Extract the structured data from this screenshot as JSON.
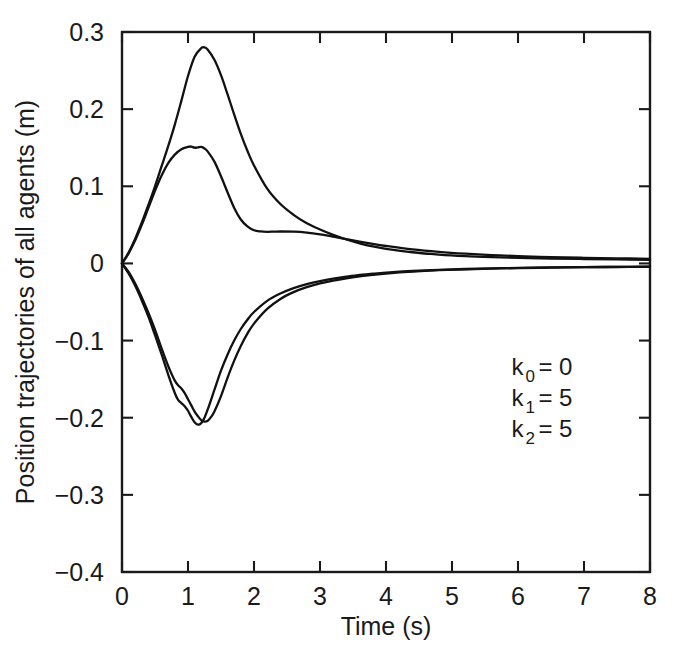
{
  "chart_data": {
    "type": "line",
    "title": "",
    "xlabel": "Time (s)",
    "ylabel": "Position trajectories of all agents (m)",
    "xlim": [
      0,
      8
    ],
    "ylim": [
      -0.4,
      0.3
    ],
    "grid": false,
    "legend": null,
    "xticks": [
      0,
      1,
      2,
      3,
      4,
      5,
      6,
      7,
      8
    ],
    "xticklabels": [
      "0",
      "1",
      "2",
      "3",
      "4",
      "5",
      "6",
      "7",
      "8"
    ],
    "yticks": [
      -0.4,
      -0.3,
      -0.2,
      -0.1,
      0,
      0.1,
      0.2,
      0.3
    ],
    "yticklabels": [
      "−0.4",
      "−0.3",
      "−0.2",
      "−0.1",
      "0",
      "0.1",
      "0.2",
      "0.3"
    ],
    "annotations": [
      {
        "name": "k0",
        "base": "k",
        "sub": "0",
        "eq": "= 0",
        "x": 5.9,
        "y": -0.145
      },
      {
        "name": "k1",
        "base": "k",
        "sub": "1",
        "eq": "= 5",
        "x": 5.9,
        "y": -0.185
      },
      {
        "name": "k2",
        "base": "k",
        "sub": "2",
        "eq": "= 5",
        "x": 5.9,
        "y": -0.225
      }
    ],
    "series": [
      {
        "name": "agent-1-positive-large",
        "color": "#111111",
        "x": [
          0.0,
          0.1,
          0.2,
          0.3,
          0.4,
          0.5,
          0.6,
          0.7,
          0.8,
          0.9,
          1.0,
          1.1,
          1.2,
          1.25,
          1.3,
          1.4,
          1.5,
          1.6,
          1.7,
          1.8,
          1.9,
          2.0,
          2.2,
          2.4,
          2.6,
          2.8,
          3.0,
          3.2,
          3.4,
          3.6,
          3.8,
          4.0,
          4.4,
          4.8,
          5.2,
          5.6,
          6.0,
          6.5,
          7.0,
          7.5,
          8.0
        ],
        "y": [
          0.0,
          0.014,
          0.032,
          0.053,
          0.076,
          0.1,
          0.126,
          0.152,
          0.18,
          0.211,
          0.243,
          0.268,
          0.279,
          0.28,
          0.277,
          0.264,
          0.244,
          0.219,
          0.193,
          0.168,
          0.146,
          0.127,
          0.097,
          0.077,
          0.063,
          0.052,
          0.044,
          0.037,
          0.031,
          0.026,
          0.022,
          0.019,
          0.0145,
          0.0115,
          0.0095,
          0.0082,
          0.0072,
          0.0063,
          0.0057,
          0.0052,
          0.0048
        ]
      },
      {
        "name": "agent-2-positive-small",
        "color": "#111111",
        "x": [
          0.0,
          0.1,
          0.2,
          0.3,
          0.4,
          0.5,
          0.6,
          0.7,
          0.8,
          0.9,
          1.0,
          1.05,
          1.1,
          1.15,
          1.2,
          1.25,
          1.3,
          1.4,
          1.5,
          1.6,
          1.7,
          1.8,
          1.9,
          2.0,
          2.1,
          2.2,
          2.3,
          2.4,
          2.6,
          2.8,
          3.0,
          3.2,
          3.4,
          3.6,
          3.8,
          4.0,
          4.4,
          4.8,
          5.2,
          5.6,
          6.0,
          6.5,
          7.0,
          7.5,
          8.0
        ],
        "y": [
          0.0,
          0.013,
          0.03,
          0.05,
          0.072,
          0.094,
          0.114,
          0.13,
          0.141,
          0.148,
          0.151,
          0.1515,
          0.15,
          0.1505,
          0.151,
          0.149,
          0.145,
          0.132,
          0.113,
          0.092,
          0.072,
          0.057,
          0.048,
          0.043,
          0.0415,
          0.041,
          0.0412,
          0.0414,
          0.0412,
          0.04,
          0.0378,
          0.0348,
          0.0315,
          0.0282,
          0.0252,
          0.0226,
          0.0182,
          0.015,
          0.0126,
          0.0108,
          0.0095,
          0.0082,
          0.0073,
          0.0066,
          0.006
        ]
      },
      {
        "name": "agent-3-negative-deep",
        "color": "#111111",
        "x": [
          0.0,
          0.1,
          0.2,
          0.3,
          0.4,
          0.5,
          0.6,
          0.7,
          0.8,
          0.85,
          0.9,
          0.95,
          1.0,
          1.05,
          1.1,
          1.15,
          1.2,
          1.25,
          1.3,
          1.4,
          1.5,
          1.6,
          1.7,
          1.8,
          1.9,
          2.0,
          2.2,
          2.4,
          2.6,
          2.8,
          3.0,
          3.2,
          3.4,
          3.6,
          3.8,
          4.0,
          4.4,
          4.8,
          5.2,
          5.6,
          6.0,
          6.5,
          7.0,
          7.5,
          8.0
        ],
        "y": [
          0.0,
          -0.013,
          -0.029,
          -0.048,
          -0.069,
          -0.093,
          -0.118,
          -0.144,
          -0.168,
          -0.177,
          -0.181,
          -0.185,
          -0.191,
          -0.199,
          -0.206,
          -0.209,
          -0.207,
          -0.2,
          -0.189,
          -0.164,
          -0.139,
          -0.118,
          -0.1,
          -0.085,
          -0.073,
          -0.063,
          -0.0485,
          -0.039,
          -0.032,
          -0.0268,
          -0.0228,
          -0.0196,
          -0.017,
          -0.015,
          -0.0133,
          -0.0119,
          -0.0098,
          -0.0083,
          -0.0072,
          -0.0064,
          -0.0058,
          -0.0052,
          -0.0048,
          -0.0045,
          -0.0042
        ]
      },
      {
        "name": "agent-4-negative-shallow",
        "color": "#111111",
        "x": [
          0.0,
          0.1,
          0.2,
          0.3,
          0.4,
          0.5,
          0.6,
          0.7,
          0.75,
          0.8,
          0.85,
          0.9,
          0.95,
          1.0,
          1.05,
          1.1,
          1.15,
          1.2,
          1.25,
          1.3,
          1.35,
          1.4,
          1.5,
          1.6,
          1.7,
          1.8,
          1.9,
          2.0,
          2.2,
          2.4,
          2.6,
          2.8,
          3.0,
          3.2,
          3.4,
          3.6,
          3.8,
          4.0,
          4.4,
          4.8,
          5.2,
          5.6,
          6.0,
          6.5,
          7.0,
          7.5,
          8.0
        ],
        "y": [
          0.0,
          -0.011,
          -0.026,
          -0.044,
          -0.064,
          -0.086,
          -0.11,
          -0.133,
          -0.143,
          -0.152,
          -0.158,
          -0.162,
          -0.168,
          -0.176,
          -0.184,
          -0.192,
          -0.198,
          -0.203,
          -0.205,
          -0.204,
          -0.199,
          -0.192,
          -0.172,
          -0.148,
          -0.126,
          -0.107,
          -0.091,
          -0.078,
          -0.059,
          -0.046,
          -0.0372,
          -0.0308,
          -0.026,
          -0.0222,
          -0.0192,
          -0.0168,
          -0.0148,
          -0.0131,
          -0.0106,
          -0.0088,
          -0.0076,
          -0.0067,
          -0.006,
          -0.0054,
          -0.0049,
          -0.0046,
          -0.0043
        ]
      }
    ]
  }
}
